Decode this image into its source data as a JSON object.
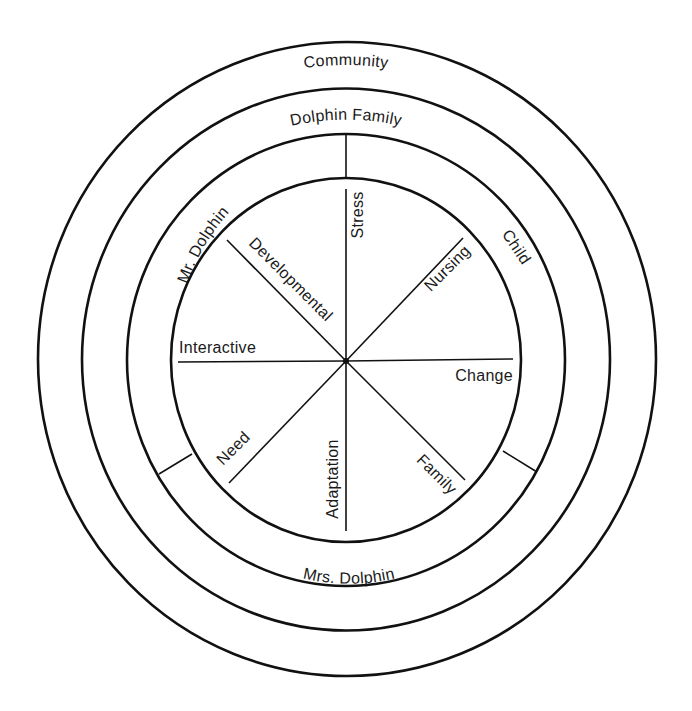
{
  "diagram": {
    "center": {
      "x": 346,
      "y": 361
    },
    "rings": [
      {
        "name": "community",
        "label": "Community",
        "rx": 309,
        "ry": 317
      },
      {
        "name": "dolphin-family",
        "label": "Dolphin Family",
        "rx": 264,
        "ry": 271
      },
      {
        "name": "family-members",
        "rx": 219,
        "ry": 226
      },
      {
        "name": "inner-concepts",
        "rx": 175,
        "ry": 182
      }
    ],
    "members_ring": {
      "segments": [
        {
          "name": "mr-dolphin",
          "label": "Mr. Dolphin"
        },
        {
          "name": "child",
          "label": "Child"
        },
        {
          "name": "mrs-dolphin",
          "label": "Mrs. Dolphin"
        }
      ]
    },
    "spokes": [
      {
        "name": "stress",
        "label": "Stress"
      },
      {
        "name": "nursing",
        "label": "Nursing"
      },
      {
        "name": "change",
        "label": "Change"
      },
      {
        "name": "family",
        "label": "Family"
      },
      {
        "name": "adaptation",
        "label": "Adaptation"
      },
      {
        "name": "need",
        "label": "Need"
      },
      {
        "name": "interactive",
        "label": "Interactive"
      },
      {
        "name": "developmental",
        "label": "Developmental"
      }
    ],
    "colors": {
      "line": "#111111",
      "text": "#1a1a1a",
      "background": "#ffffff"
    }
  }
}
